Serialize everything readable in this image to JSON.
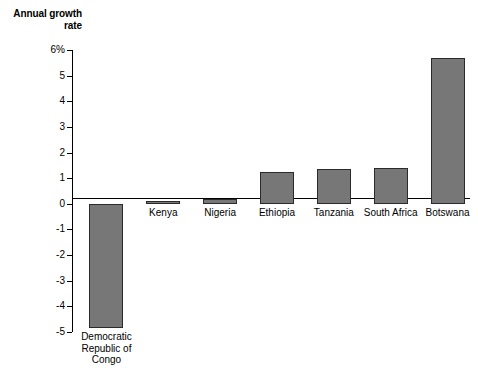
{
  "chart_data": {
    "type": "bar",
    "title": "",
    "ylabel": "Annual growth rate",
    "xlabel": "",
    "categories": [
      "Democratic\nRepublic of\nCongo",
      "Kenya",
      "Nigeria",
      "Ethiopia",
      "Tanzania",
      "South Africa",
      "Botswana"
    ],
    "values": [
      -4.85,
      0.1,
      0.2,
      1.25,
      1.37,
      1.4,
      5.7
    ],
    "ylim": [
      -5,
      6
    ],
    "yticks": [
      6,
      5,
      4,
      3,
      2,
      1,
      0,
      -1,
      -2,
      -3,
      -4,
      -5
    ],
    "ytick_labels": [
      "6%",
      "5",
      "4",
      "3",
      "2",
      "1",
      "0",
      "-1",
      "-2",
      "-3",
      "-4",
      "-5"
    ],
    "grid": false,
    "legend": "none",
    "bar_fill_color": "#777777",
    "bar_edge_color": "#2b2b2b",
    "axis_color": "#000000",
    "background_color": "#ffffff"
  }
}
